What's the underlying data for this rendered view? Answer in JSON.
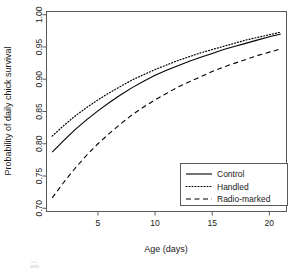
{
  "chart_data": {
    "type": "line",
    "title": "",
    "xlabel": "Age (days)",
    "ylabel": "Probability of daily chick survival",
    "xlim": [
      0.5,
      21.5
    ],
    "ylim": [
      0.695,
      1.005
    ],
    "xticks": [
      5,
      10,
      15,
      20
    ],
    "xtick_labels": [
      "5",
      "10",
      "15",
      "20"
    ],
    "yticks": [
      0.7,
      0.75,
      0.8,
      0.85,
      0.9,
      0.95,
      1.0
    ],
    "ytick_labels": [
      "0.70",
      "0.75",
      "0.80",
      "0.85",
      "0.90",
      "0.95",
      "1.00"
    ],
    "grid": false,
    "legend_position": "bottom-right",
    "x": [
      1,
      2,
      3,
      4,
      5,
      6,
      7,
      8,
      9,
      10,
      11,
      12,
      13,
      14,
      15,
      16,
      17,
      18,
      19,
      20,
      21
    ],
    "series": [
      {
        "name": "Control",
        "linestyle": "solid",
        "color": "#000000",
        "values": [
          0.787,
          0.805,
          0.822,
          0.837,
          0.851,
          0.864,
          0.876,
          0.887,
          0.897,
          0.906,
          0.914,
          0.921,
          0.928,
          0.934,
          0.94,
          0.946,
          0.951,
          0.956,
          0.961,
          0.966,
          0.97
        ]
      },
      {
        "name": "Handled",
        "linestyle": "dotted",
        "color": "#000000",
        "values": [
          0.812,
          0.828,
          0.843,
          0.856,
          0.868,
          0.879,
          0.889,
          0.899,
          0.907,
          0.915,
          0.922,
          0.929,
          0.935,
          0.941,
          0.946,
          0.951,
          0.956,
          0.961,
          0.965,
          0.969,
          0.973
        ]
      },
      {
        "name": "Radio-marked",
        "linestyle": "dashed",
        "color": "#000000",
        "values": [
          0.716,
          0.74,
          0.762,
          0.782,
          0.8,
          0.816,
          0.831,
          0.845,
          0.857,
          0.868,
          0.878,
          0.888,
          0.896,
          0.904,
          0.912,
          0.919,
          0.925,
          0.931,
          0.937,
          0.942,
          0.947
        ]
      }
    ]
  },
  "axis": {
    "x_title": "Age (days)",
    "y_title": "Probability of daily chick survival",
    "x_tick_labels": [
      "5",
      "10",
      "15",
      "20"
    ],
    "y_tick_labels": [
      "0.70",
      "0.75",
      "0.80",
      "0.85",
      "0.90",
      "0.95",
      "1.00"
    ]
  },
  "legend": {
    "entries": [
      {
        "label": "Control",
        "style": "solid"
      },
      {
        "label": "Handled",
        "style": "dotted"
      },
      {
        "label": "Radio-marked",
        "style": "dashed"
      }
    ]
  },
  "colors": {
    "line": "#000000",
    "frame": "#5a5a5a",
    "text": "#1a1a1a",
    "background": "#ffffff"
  }
}
